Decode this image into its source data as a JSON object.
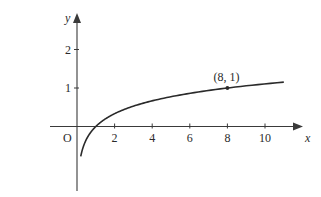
{
  "chart_data": {
    "type": "line",
    "title": "",
    "xlabel": "x",
    "ylabel": "y",
    "origin_label": "O",
    "function": "y = log_8(x)",
    "xlim": [
      0,
      11
    ],
    "ylim": [
      -0.8,
      2.5
    ],
    "x_ticks": [
      2,
      4,
      6,
      8,
      10
    ],
    "x_tick_labels": [
      "2",
      "4",
      "6",
      "8",
      "10"
    ],
    "y_ticks": [
      1,
      2
    ],
    "y_tick_labels": [
      "1",
      "2"
    ],
    "grid": false,
    "legend": null,
    "series": [
      {
        "name": "curve",
        "x": [
          0.2,
          0.3,
          0.5,
          0.75,
          1,
          1.5,
          2,
          3,
          4,
          5,
          6,
          7,
          8,
          9,
          10,
          11
        ],
        "values": [
          -0.774,
          -0.579,
          -0.333,
          -0.138,
          0,
          0.195,
          0.333,
          0.528,
          0.667,
          0.774,
          0.862,
          0.936,
          1.0,
          1.057,
          1.107,
          1.153
        ]
      }
    ],
    "annotations": [
      {
        "x": 8,
        "y": 1,
        "text": "(8, 1)",
        "marker": "dot"
      }
    ]
  },
  "colors": {
    "curve": "#2a2a2a",
    "axes": "#3a3a3a",
    "background": "#ffffff"
  }
}
